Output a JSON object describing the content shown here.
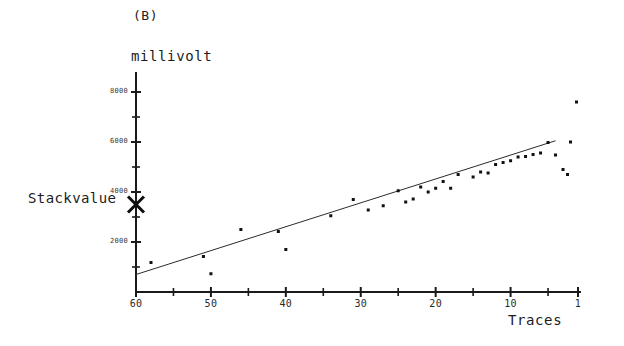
{
  "panel": {
    "label": "(B)"
  },
  "axes": {
    "y_title": "millivolt",
    "x_title": "Traces",
    "stackvalue_label": "Stackvalue"
  },
  "chart_data": {
    "type": "scatter",
    "title": "(B)",
    "xlabel": "Traces",
    "ylabel": "millivolt",
    "grid": false,
    "legend": null,
    "xlim": [
      60,
      1
    ],
    "ylim": [
      0,
      8800
    ],
    "x_inverted": true,
    "x_major_ticks": [
      60,
      50,
      40,
      30,
      20,
      10,
      1
    ],
    "x_minor_ticks": [
      55,
      45,
      35,
      25,
      15,
      5
    ],
    "y_major_ticks": [
      2000,
      4000,
      6000,
      8000
    ],
    "y_minor_ticks": [
      1000,
      3000,
      5000,
      7000
    ],
    "y_tick_labels": [
      "2000",
      "4000",
      "6000",
      "8000"
    ],
    "x_tick_labels": [
      "60",
      "50",
      "40",
      "30",
      "20",
      "10",
      "1"
    ],
    "annotations": [
      {
        "name": "stackvalue-marker",
        "text": "Stackvalue",
        "marker": "x-cross",
        "x": 60,
        "y": 3500,
        "on_axis": true
      }
    ],
    "series": [
      {
        "name": "trendline",
        "type": "line",
        "points": [
          {
            "x": 60,
            "y": 700
          },
          {
            "x": 4,
            "y": 6050
          }
        ]
      },
      {
        "name": "measurements",
        "type": "scatter",
        "marker": "dot",
        "points": [
          {
            "x": 58,
            "y": 1180
          },
          {
            "x": 51,
            "y": 1420
          },
          {
            "x": 50,
            "y": 730
          },
          {
            "x": 46,
            "y": 2500
          },
          {
            "x": 41,
            "y": 2420
          },
          {
            "x": 40,
            "y": 1700
          },
          {
            "x": 34,
            "y": 3050
          },
          {
            "x": 31,
            "y": 3700
          },
          {
            "x": 29,
            "y": 3280
          },
          {
            "x": 27,
            "y": 3450
          },
          {
            "x": 25,
            "y": 4050
          },
          {
            "x": 24,
            "y": 3600
          },
          {
            "x": 23,
            "y": 3720
          },
          {
            "x": 22,
            "y": 4200
          },
          {
            "x": 21,
            "y": 4000
          },
          {
            "x": 20,
            "y": 4150
          },
          {
            "x": 19,
            "y": 4420
          },
          {
            "x": 18,
            "y": 4150
          },
          {
            "x": 17,
            "y": 4700
          },
          {
            "x": 15,
            "y": 4600
          },
          {
            "x": 14,
            "y": 4800
          },
          {
            "x": 13,
            "y": 4760
          },
          {
            "x": 12,
            "y": 5100
          },
          {
            "x": 11,
            "y": 5180
          },
          {
            "x": 10,
            "y": 5250
          },
          {
            "x": 9,
            "y": 5400
          },
          {
            "x": 8,
            "y": 5420
          },
          {
            "x": 7,
            "y": 5500
          },
          {
            "x": 6,
            "y": 5560
          },
          {
            "x": 5,
            "y": 5980
          },
          {
            "x": 4,
            "y": 5480
          },
          {
            "x": 3,
            "y": 4900
          },
          {
            "x": 2.4,
            "y": 4700
          },
          {
            "x": 2,
            "y": 6000
          },
          {
            "x": 1.2,
            "y": 7600
          }
        ]
      }
    ]
  }
}
